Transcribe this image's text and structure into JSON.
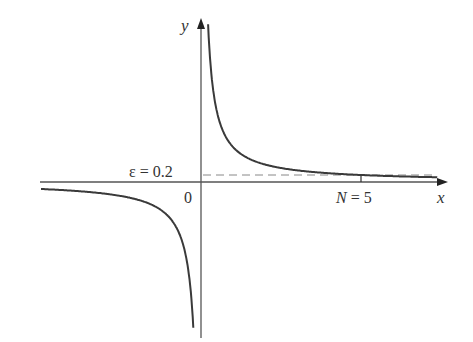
{
  "chart_data": {
    "type": "line",
    "title": "",
    "function": "y = 1/x",
    "xlabel": "x",
    "ylabel": "y",
    "origin_label": "0",
    "annotations": [
      {
        "text": "ε = 0.2",
        "kind": "horizontal-dashed-line",
        "y": 0.2
      },
      {
        "text": "N = 5",
        "kind": "x-tick",
        "x": 5
      }
    ],
    "series": [
      {
        "name": "1/x (x>0)",
        "x": [
          0.28,
          0.35,
          0.5,
          0.75,
          1,
          1.5,
          2,
          3,
          4,
          5,
          6,
          7.4
        ],
        "y": [
          3.57,
          2.86,
          2.0,
          1.33,
          1.0,
          0.67,
          0.5,
          0.33,
          0.25,
          0.2,
          0.167,
          0.135
        ]
      },
      {
        "name": "1/x (x<0)",
        "x": [
          -5,
          -4,
          -3,
          -2,
          -1.5,
          -1,
          -0.75,
          -0.6,
          -0.5,
          -0.45
        ],
        "y": [
          -0.2,
          -0.25,
          -0.33,
          -0.5,
          -0.67,
          -1.0,
          -1.33,
          -1.67,
          -2.0,
          -2.2
        ]
      }
    ],
    "xlim": [
      -5,
      7.8
    ],
    "ylim": [
      -4.5,
      4.7
    ],
    "grid": false,
    "legend": "none"
  },
  "labels": {
    "x_axis": "x",
    "y_axis": "y",
    "origin": "0",
    "epsilon": "ε = 0.2",
    "n_tick": "N = 5"
  },
  "colors": {
    "curve": "#3a3a3a",
    "axis": "#555555",
    "dashed": "#888888",
    "text": "#333333"
  }
}
